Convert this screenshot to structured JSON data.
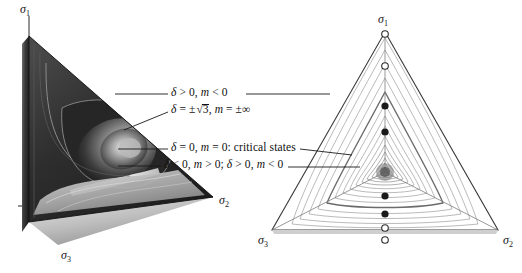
{
  "figure": {
    "kind": "scientific-illustration",
    "background": "#ffffff",
    "ink": "#101010"
  },
  "left_panel": {
    "name": "three-dimensional-yield-surface",
    "axes": [
      {
        "id": "sigma1",
        "label": "σ",
        "sub": "1",
        "x": 22,
        "y": 4
      },
      {
        "id": "sigma2",
        "label": "σ",
        "sub": "2",
        "x": 219,
        "y": 196
      },
      {
        "id": "sigma3",
        "label": "σ",
        "sub": "3",
        "x": 60,
        "y": 250
      }
    ]
  },
  "right_panel": {
    "name": "pi-plane-section",
    "axes": [
      {
        "id": "sigma1",
        "label": "σ",
        "sub": "1",
        "x": 378,
        "y": 14
      },
      {
        "id": "sigma2",
        "label": "σ",
        "sub": "2",
        "x": 503,
        "y": 235
      },
      {
        "id": "sigma3",
        "label": "σ",
        "sub": "3",
        "x": 260,
        "y": 234
      }
    ],
    "markers": [
      {
        "index": 0,
        "style": "open",
        "axis_pos": 0.0,
        "note": "apex of triangle"
      },
      {
        "index": 1,
        "style": "open",
        "axis_pos": 0.18
      },
      {
        "index": 2,
        "style": "filled",
        "axis_pos": 0.42
      },
      {
        "index": 3,
        "style": "filled",
        "axis_pos": 0.57
      },
      {
        "index": 4,
        "style": "filled",
        "axis_pos": 0.78
      },
      {
        "index": 5,
        "style": "filled",
        "axis_pos": 0.9
      },
      {
        "index": 6,
        "style": "open",
        "axis_pos": 1.0
      },
      {
        "index": 7,
        "style": "open",
        "axis_pos": 1.06,
        "note": "below base line"
      }
    ],
    "contour_count": 14
  },
  "annotations": [
    {
      "id": "ann-1",
      "text": "δ > 0, m < 0",
      "parts": [
        {
          "t": "δ",
          "it": true
        },
        {
          "t": " > 0, ",
          "it": false
        },
        {
          "t": "m",
          "it": true
        },
        {
          "t": " < 0",
          "it": false
        }
      ],
      "x": 171,
      "y": 89,
      "leader_left": {
        "x1": 115,
        "y1": 94,
        "x2": 168,
        "y2": 94
      },
      "leader_right": {
        "x1": 246,
        "y1": 94,
        "x2": 382,
        "y2": 94
      }
    },
    {
      "id": "ann-2",
      "text": "δ = ±√3, m = ±∞",
      "x": 171,
      "y": 106,
      "leader_left": {
        "x1": 127,
        "y1": 128,
        "x2": 168,
        "y2": 112
      },
      "leader_right": null
    },
    {
      "id": "ann-3",
      "text": "δ = 0, m = 0: critical states",
      "parts": [
        {
          "t": "δ",
          "it": true
        },
        {
          "t": " = 0, ",
          "it": false
        },
        {
          "t": "m",
          "it": true
        },
        {
          "t": " = 0: critical states",
          "it": false
        }
      ],
      "x": 171,
      "y": 144,
      "leader_left": {
        "x1": 118,
        "y1": 149,
        "x2": 168,
        "y2": 149
      },
      "leader_right": {
        "x1": 318,
        "y1": 149,
        "x2": 362,
        "y2": 152
      }
    },
    {
      "id": "ann-4",
      "text": "δ < 0, m > 0; δ > 0, m < 0",
      "parts": [
        {
          "t": "δ",
          "it": true
        },
        {
          "t": " < 0, ",
          "it": false
        },
        {
          "t": "m",
          "it": true
        },
        {
          "t": " > 0; ",
          "it": false
        },
        {
          "t": "δ",
          "it": true
        },
        {
          "t": " > 0, ",
          "it": false
        },
        {
          "t": "m",
          "it": true
        },
        {
          "t": " < 0",
          "it": false
        }
      ],
      "x": 164,
      "y": 160,
      "leader_left": {
        "x1": 118,
        "y1": 166,
        "x2": 161,
        "y2": 166
      },
      "leader_right": {
        "x1": 288,
        "y1": 166,
        "x2": 368,
        "y2": 166
      }
    }
  ],
  "symbols": {
    "sqrt_radicand": "3",
    "pm": "±",
    "infinity": "∞",
    "delta": "δ",
    "m": "m",
    "sigma": "σ"
  }
}
